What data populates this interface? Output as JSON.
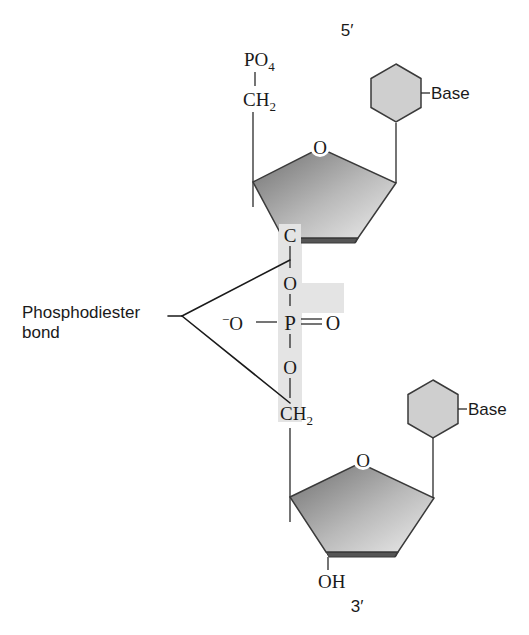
{
  "diagram": {
    "top_end_label": "5′",
    "bottom_end_label": "3′",
    "colors": {
      "sugar_fill_light": "#e9e9e9",
      "sugar_fill_dark": "#7a7a7a",
      "sugar_edge": "#4a4a4a",
      "base_fill": "#cfcfcf",
      "highlight": "#e4e4e4",
      "ink": "#1a1a1a"
    },
    "upper_nucleotide": {
      "phosphate_label": "PO",
      "phosphate_subscript": "4",
      "methylene_label": "CH",
      "methylene_subscript": "2",
      "ring_oxygen": "O",
      "carbon_3_label": "C",
      "base_label": "Base"
    },
    "phosphate_bridge": {
      "upper_oxygen": "O",
      "phosphorus": "P",
      "double_bond_oxygen": "O",
      "charged_oxygen": "−O",
      "charge_sign": "−",
      "lower_oxygen": "O"
    },
    "lower_nucleotide": {
      "methylene_label": "CH",
      "methylene_subscript": "2",
      "ring_oxygen": "O",
      "hydroxyl_label": "OH",
      "base_label": "Base"
    },
    "callout": {
      "line1": "Phosphodiester",
      "line2": "bond"
    }
  }
}
